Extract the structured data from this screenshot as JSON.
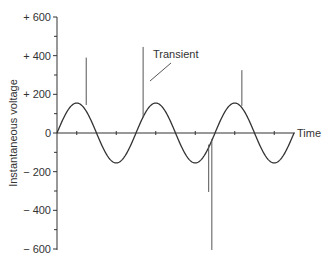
{
  "chart_data": {
    "type": "line",
    "title": "",
    "xlabel": "Time",
    "ylabel": "Instantaneous voltage",
    "ylim": [
      -600,
      600
    ],
    "y_ticks": [
      600,
      400,
      200,
      0,
      -200,
      -400,
      -600
    ],
    "y_tick_labels": [
      "+ 600",
      "+ 400",
      "+ 200",
      "0",
      "− 200",
      "− 400",
      "− 600"
    ],
    "y_minor_ticks": [
      500,
      300,
      100,
      -100,
      -300,
      -500
    ],
    "x_ticks_count": 6,
    "grid": false,
    "legend": null,
    "series": [
      {
        "name": "Sine wave",
        "type": "sine",
        "amplitude": 155,
        "cycles": 3,
        "color": "#333333"
      }
    ],
    "transients": [
      {
        "phase_cycles": 0.37,
        "from": 145,
        "to": 390
      },
      {
        "phase_cycles": 1.09,
        "from": 80,
        "to": 445
      },
      {
        "phase_cycles": 2.34,
        "from": 140,
        "to": 325
      },
      {
        "phase_cycles": 1.92,
        "from": -60,
        "to": -305
      },
      {
        "phase_cycles": 1.96,
        "from": -30,
        "to": -605
      }
    ],
    "annotations": [
      {
        "text": "Transient",
        "points_to_transient": 1
      }
    ]
  },
  "labels": {
    "x_axis": "Time",
    "y_axis": "Instantaneous voltage",
    "annotation": "Transient"
  },
  "colors": {
    "line": "#333333",
    "transient": "#555555",
    "background": "#ffffff"
  }
}
